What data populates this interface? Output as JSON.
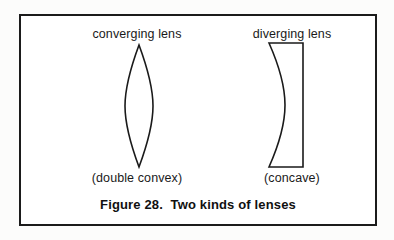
{
  "figure": {
    "caption": "Figure 28.  Two kinds of lenses",
    "caption_number": "Figure 28.",
    "caption_title": "Two kinds of lenses",
    "border_color": "#1b1b1b",
    "background_color": "#ffffff",
    "ink_color": "#1a1a1a"
  },
  "lenses": [
    {
      "id": "converging",
      "top_label": "converging lens",
      "bottom_label": "(double convex)",
      "shape_name": "biconvex-lens-shape",
      "shape_description": "lens / almond outline, pointed at top and bottom, bulging on both sides"
    },
    {
      "id": "diverging",
      "top_label": "diverging lens",
      "bottom_label": "(concave)",
      "shape_name": "plano-concave-lens-shape",
      "shape_description": "flat right edge with a left edge curving inward, thin in the middle"
    }
  ]
}
